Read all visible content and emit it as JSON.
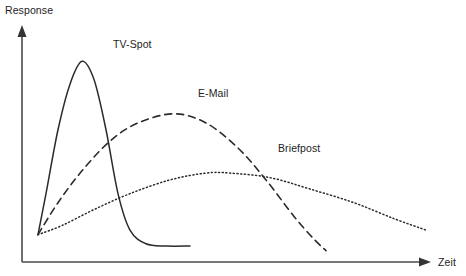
{
  "chart_data": {
    "type": "line",
    "title": "",
    "subtitle": "",
    "xlabel": "Zeit",
    "ylabel": "Response",
    "grid": false,
    "legend_position": "inline-annotations",
    "axis_style": "arrow-axes-unlabeled",
    "xlim": [
      0,
      100
    ],
    "ylim": [
      0,
      100
    ],
    "x_tick_labels": [],
    "y_tick_labels": [],
    "series": [
      {
        "name": "TV-Spot",
        "line_style": "solid",
        "color": "#2b2b2b",
        "label_x": 113,
        "label_y": 48,
        "peak": {
          "x": 15,
          "y": 88
        },
        "points": [
          {
            "x": 4,
            "y": 12
          },
          {
            "x": 6,
            "y": 30
          },
          {
            "x": 9,
            "y": 58
          },
          {
            "x": 12,
            "y": 78
          },
          {
            "x": 15,
            "y": 88
          },
          {
            "x": 18,
            "y": 80
          },
          {
            "x": 21,
            "y": 58
          },
          {
            "x": 24,
            "y": 30
          },
          {
            "x": 27,
            "y": 14
          },
          {
            "x": 31,
            "y": 8
          },
          {
            "x": 36,
            "y": 7
          },
          {
            "x": 42,
            "y": 7
          }
        ]
      },
      {
        "name": "E-Mail",
        "line_style": "dashed",
        "color": "#2b2b2b",
        "label_x": 198,
        "label_y": 97,
        "peak": {
          "x": 38,
          "y": 65
        },
        "points": [
          {
            "x": 4,
            "y": 12
          },
          {
            "x": 9,
            "y": 26
          },
          {
            "x": 15,
            "y": 40
          },
          {
            "x": 22,
            "y": 53
          },
          {
            "x": 29,
            "y": 61
          },
          {
            "x": 38,
            "y": 65
          },
          {
            "x": 46,
            "y": 61
          },
          {
            "x": 54,
            "y": 50
          },
          {
            "x": 61,
            "y": 36
          },
          {
            "x": 68,
            "y": 20
          },
          {
            "x": 73,
            "y": 10
          },
          {
            "x": 76,
            "y": 5
          }
        ]
      },
      {
        "name": "Briefpost",
        "line_style": "dotted",
        "color": "#2b2b2b",
        "label_x": 278,
        "label_y": 152,
        "peak": {
          "x": 52,
          "y": 39
        },
        "points": [
          {
            "x": 4,
            "y": 12
          },
          {
            "x": 10,
            "y": 16
          },
          {
            "x": 18,
            "y": 23
          },
          {
            "x": 27,
            "y": 30
          },
          {
            "x": 37,
            "y": 36
          },
          {
            "x": 46,
            "y": 39
          },
          {
            "x": 52,
            "y": 39
          },
          {
            "x": 62,
            "y": 37
          },
          {
            "x": 72,
            "y": 32
          },
          {
            "x": 83,
            "y": 26
          },
          {
            "x": 93,
            "y": 19
          },
          {
            "x": 101,
            "y": 14
          }
        ]
      }
    ]
  },
  "axes": {
    "y_axis_label": "Response",
    "x_axis_label": "Zeit"
  }
}
